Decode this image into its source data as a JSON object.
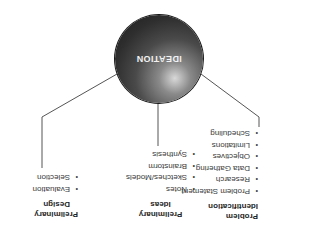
{
  "diagram": {
    "hub": {
      "label": "IDEATION",
      "color": "#2e2e2e"
    },
    "branches": [
      {
        "id": "problem",
        "heading_line1": "Problem",
        "heading_line2": "Identification",
        "items": [
          "Problem Statement",
          "Research",
          "Data Gathering",
          "Objectives",
          "Limitations",
          "Scheduling"
        ]
      },
      {
        "id": "ideas",
        "heading_line1": "Preliminary",
        "heading_line2": "Ideas",
        "items": [
          "Notes",
          "Sketches/Models",
          "Brainstorm",
          "Synthesis"
        ]
      },
      {
        "id": "design",
        "heading_line1": "Preliminary",
        "heading_line2": "Design",
        "items": [
          "Evaluation",
          "Selection"
        ]
      }
    ],
    "bullet": "•",
    "orientation": "rotated 180°"
  }
}
